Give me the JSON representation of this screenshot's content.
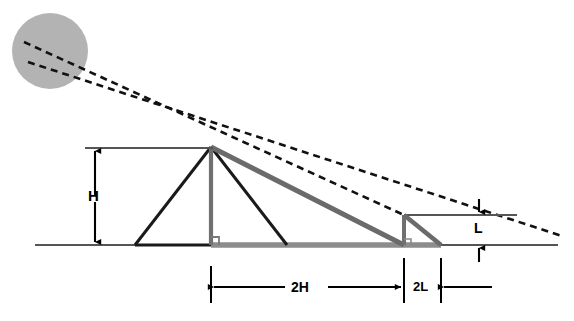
{
  "figure": {
    "type": "geometry-diagram",
    "title": "",
    "background_color": "#ffffff"
  },
  "colors": {
    "sun_fill": "#b3b3b3",
    "ground_line": "#555555",
    "shadow_gray": "#808080",
    "ray_gray": "#6b6b6b",
    "structure_black": "#1a1a1a",
    "dashed_ray": "#111111",
    "label_text": "#000000"
  },
  "labels": {
    "height_tall": "H",
    "shadow_tall": "2H",
    "shadow_short": "2L",
    "height_short": "L"
  },
  "elements": {
    "sun": {
      "name": "sun",
      "cx": 50,
      "cy": 51,
      "r": 38
    },
    "ground": {
      "name": "ground-line",
      "x1": 35,
      "y1": 245,
      "x2": 558,
      "y2": 245
    },
    "tall_object": {
      "apex_x": 211,
      "apex_y": 147,
      "base_left_x": 135,
      "base_right_x": 287,
      "base_y": 245,
      "vertical_x": 211
    },
    "short_object": {
      "apex_x": 404,
      "apex_y": 215,
      "base_x": 404,
      "base_y": 245,
      "shadow_end_x": 440
    },
    "shadow_tall_span": {
      "x_start": 211,
      "x_end": 404,
      "y": 245
    },
    "shadow_short_span": {
      "x_start": 404,
      "x_end": 441,
      "y": 245
    },
    "ray_upper": {
      "x1": 24,
      "y1": 42,
      "x2": 404,
      "y2": 215
    },
    "ray_lower": {
      "x1": 28,
      "y1": 62,
      "x2": 560,
      "y2": 235
    },
    "dim_H": {
      "x": 95,
      "y_top": 148,
      "y_bottom": 245
    },
    "dim_2H": {
      "y": 287,
      "x_left": 211,
      "x_right": 404
    },
    "dim_2L": {
      "y": 287,
      "x_left": 404,
      "x_right": 441
    },
    "dim_L": {
      "x": 479,
      "y_top": 215,
      "y_bottom": 245
    }
  }
}
